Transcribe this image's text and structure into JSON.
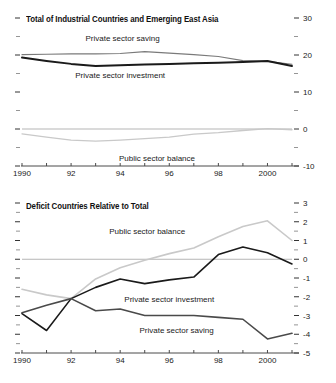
{
  "chart_data": [
    {
      "type": "line",
      "title": "Total of Industrial Countries and Emerging East Asia",
      "xlabel": "",
      "ylabel": "",
      "x": [
        1990,
        1991,
        1992,
        1993,
        1994,
        1995,
        1996,
        1997,
        1998,
        1999,
        2000,
        2001
      ],
      "xlim": [
        1990,
        2001
      ],
      "ylim": [
        -10,
        30
      ],
      "yticks": [
        30,
        20,
        10,
        0,
        -10
      ],
      "ytick_labels": [
        "30",
        "20",
        "10",
        "0",
        "-10"
      ],
      "yminor": [
        25,
        15,
        5,
        -5
      ],
      "xticks": [
        1990,
        1991,
        1992,
        1993,
        1994,
        1995,
        1996,
        1997,
        1998,
        1999,
        2000,
        2001
      ],
      "xtick_labels": [
        {
          "x": 1990,
          "label": "1990"
        },
        {
          "x": 1992,
          "label": "92"
        },
        {
          "x": 1994,
          "label": "94"
        },
        {
          "x": 1996,
          "label": "96"
        },
        {
          "x": 1998,
          "label": "98"
        },
        {
          "x": 2000,
          "label": "2000"
        }
      ],
      "grid": false,
      "zero_line": 0,
      "legend_position": "inline-annotations",
      "series": [
        {
          "name": "Private sector saving",
          "color": "#7a7a7a",
          "width": 1.2,
          "label_x": 1994.1,
          "label_y": 24.3,
          "values": [
            20.1,
            20.2,
            20.3,
            20.3,
            20.4,
            20.9,
            20.5,
            20.1,
            19.6,
            18.5,
            18.3,
            17.5
          ]
        },
        {
          "name": "Private sector investment",
          "color": "#1a1a1a",
          "width": 2.0,
          "label_x": 1994.0,
          "label_y": 14.2,
          "values": [
            19.3,
            18.4,
            17.6,
            17.0,
            17.2,
            17.4,
            17.6,
            17.8,
            17.9,
            18.1,
            18.4,
            17.0
          ]
        },
        {
          "name": "Public sector balance",
          "color": "#c9c9c9",
          "width": 1.3,
          "label_x": 1995.5,
          "label_y": -8.1,
          "values": [
            -1.3,
            -2.2,
            -3.0,
            -3.3,
            -3.0,
            -2.6,
            -2.2,
            -1.4,
            -1.0,
            -0.4,
            0.1,
            -0.2
          ]
        }
      ]
    },
    {
      "type": "line",
      "title": "Deficit Countries Relative to Total",
      "xlabel": "",
      "ylabel": "",
      "x": [
        1990,
        1991,
        1992,
        1993,
        1994,
        1995,
        1996,
        1997,
        1998,
        1999,
        2000,
        2001
      ],
      "xlim": [
        1990,
        2001
      ],
      "ylim": [
        -5,
        3
      ],
      "yticks": [
        3,
        2,
        1,
        0,
        -1,
        -2,
        -3,
        -4,
        -5
      ],
      "ytick_labels": [
        "3",
        "2",
        "1",
        "0",
        "-1",
        "-2",
        "-3",
        "-4",
        "-5"
      ],
      "yminor": [
        2.5,
        1.5,
        0.5,
        -0.5,
        -1.5,
        -2.5,
        -3.5,
        -4.5
      ],
      "xticks": [
        1990,
        1991,
        1992,
        1993,
        1994,
        1995,
        1996,
        1997,
        1998,
        1999,
        2000,
        2001
      ],
      "xtick_labels": [
        {
          "x": 1990,
          "label": "1990"
        },
        {
          "x": 1992,
          "label": "92"
        },
        {
          "x": 1994,
          "label": "94"
        },
        {
          "x": 1996,
          "label": "96"
        },
        {
          "x": 1998,
          "label": "98"
        },
        {
          "x": 2000,
          "label": "2000"
        }
      ],
      "grid": false,
      "zero_line": 0,
      "legend_position": "inline-annotations",
      "series": [
        {
          "name": "Public sector balance",
          "color": "#c9c9c9",
          "width": 1.6,
          "label_x": 1995.1,
          "label_y": 1.45,
          "values": [
            -1.6,
            -1.9,
            -2.1,
            -1.05,
            -0.45,
            -0.05,
            0.3,
            0.6,
            1.2,
            1.75,
            2.05,
            1.0
          ]
        },
        {
          "name": "Private sector investment",
          "color": "#1a1a1a",
          "width": 1.6,
          "label_x": 1996.0,
          "label_y": -2.15,
          "values": [
            -2.9,
            -3.8,
            -2.1,
            -1.5,
            -1.05,
            -1.3,
            -1.1,
            -0.95,
            0.25,
            0.65,
            0.35,
            -0.25
          ]
        },
        {
          "name": "Private sector saving",
          "color": "#4a4a4a",
          "width": 1.6,
          "label_x": 1996.3,
          "label_y": -3.85,
          "values": [
            -2.85,
            -2.45,
            -2.1,
            -2.75,
            -2.65,
            -3.0,
            -3.0,
            -3.0,
            -3.1,
            -3.2,
            -4.25,
            -3.95
          ]
        }
      ]
    }
  ]
}
